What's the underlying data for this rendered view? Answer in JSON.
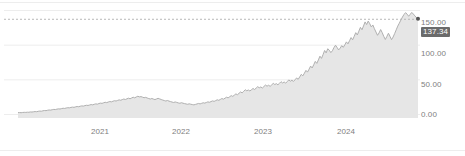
{
  "widget": {
    "title": "Price history area chart"
  },
  "chart_data": {
    "type": "area",
    "title": "",
    "subtitle": "",
    "xlabel": "",
    "ylabel": "",
    "grid": true,
    "legend": false,
    "legend_position": "none",
    "colors": {
      "line": "#b0b0b0",
      "fill": "#e6e6e6",
      "grid": "#ededed",
      "axis_text": "#808080",
      "badge_background": "#6b6b6b",
      "badge_text": "#ffffff",
      "marker": "#555555",
      "dashed_line": "#b8b8b8"
    },
    "ylim": [
      0,
      150
    ],
    "y_ticks": [
      0,
      50,
      100,
      150
    ],
    "y_tick_labels": [
      "0.00",
      "50.00",
      "100.00",
      "150.00"
    ],
    "x_tick_labels": [
      "2021",
      "2022",
      "2023",
      "2024"
    ],
    "x_tick_positions": [
      0.205,
      0.405,
      0.61,
      0.817
    ],
    "current_value": 137.34,
    "current_value_label": "137.34",
    "reference_line_value": 137.34,
    "series": [
      {
        "name": "Price",
        "values": [
          2.0,
          2.1,
          1.9,
          2.2,
          2.4,
          2.3,
          2.6,
          2.5,
          3.0,
          2.8,
          3.2,
          3.5,
          3.3,
          3.9,
          4.2,
          4.0,
          4.6,
          5.0,
          4.8,
          5.4,
          5.8,
          5.6,
          6.2,
          6.6,
          6.4,
          7.0,
          7.4,
          7.2,
          7.8,
          8.3,
          8.0,
          8.7,
          9.1,
          8.9,
          9.5,
          9.9,
          9.6,
          10.3,
          10.8,
          10.5,
          11.2,
          11.7,
          11.4,
          12.1,
          12.6,
          12.3,
          13.0,
          13.6,
          13.2,
          14.0,
          14.6,
          14.2,
          15.1,
          15.7,
          15.3,
          16.2,
          16.9,
          16.4,
          17.3,
          18.0,
          17.5,
          18.4,
          19.2,
          18.7,
          19.6,
          20.4,
          19.8,
          20.8,
          21.6,
          20.9,
          21.9,
          22.8,
          22.0,
          23.1,
          24.2,
          23.3,
          24.6,
          25.6,
          24.7,
          25.1,
          24.3,
          23.5,
          24.0,
          23.1,
          22.3,
          21.6,
          22.4,
          21.5,
          20.8,
          21.7,
          22.6,
          21.8,
          20.9,
          20.1,
          19.4,
          18.7,
          19.5,
          18.6,
          17.9,
          17.2,
          16.6,
          17.4,
          16.7,
          16.0,
          15.5,
          16.3,
          15.6,
          15.0,
          14.5,
          14.0,
          14.7,
          14.1,
          13.6,
          13.2,
          13.8,
          14.5,
          15.2,
          14.6,
          15.4,
          16.2,
          15.7,
          16.6,
          17.5,
          16.9,
          17.9,
          18.9,
          18.2,
          19.3,
          20.5,
          19.7,
          21.0,
          22.3,
          21.4,
          22.8,
          24.2,
          23.3,
          24.9,
          26.5,
          25.4,
          27.2,
          29.0,
          27.8,
          29.8,
          31.8,
          30.5,
          32.7,
          35.0,
          33.5,
          34.6,
          33.2,
          35.0,
          36.8,
          35.3,
          37.3,
          39.4,
          37.8,
          39.0,
          37.5,
          39.6,
          41.8,
          40.1,
          41.5,
          39.9,
          42.0,
          44.2,
          42.5,
          43.8,
          42.1,
          44.3,
          46.6,
          44.8,
          46.2,
          44.5,
          46.8,
          49.2,
          47.3,
          48.7,
          47.0,
          49.4,
          52.0,
          50.0,
          53.5,
          57.2,
          55.0,
          58.8,
          62.9,
          60.4,
          64.6,
          69.1,
          66.4,
          71.0,
          75.9,
          73.0,
          78.0,
          83.4,
          80.2,
          85.7,
          91.6,
          88.1,
          94.1,
          92.0,
          88.5,
          91.2,
          95.8,
          99.2,
          96.0,
          92.4,
          95.0,
          98.6,
          96.2,
          99.8,
          104.0,
          101.2,
          105.6,
          110.2,
          107.0,
          112.0,
          117.3,
          114.0,
          119.5,
          125.0,
          121.5,
          127.0,
          132.8,
          129.0,
          134.0,
          130.2,
          125.6,
          128.4,
          123.0,
          118.2,
          113.5,
          117.0,
          121.8,
          117.4,
          112.0,
          107.5,
          111.8,
          116.5,
          112.0,
          107.2,
          111.0,
          116.0,
          121.4,
          126.8,
          131.0,
          135.5,
          139.8,
          143.5,
          146.2,
          144.0,
          141.0,
          143.8,
          146.5,
          144.2,
          141.5,
          139.0,
          137.34
        ]
      }
    ]
  }
}
